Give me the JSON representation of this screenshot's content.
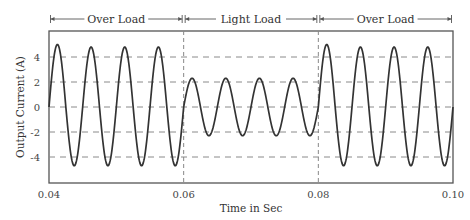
{
  "chart_data": {
    "type": "line",
    "title": "",
    "xlabel": "Time in Sec",
    "ylabel": "Output Current (A)",
    "xlim": [
      0.04,
      0.1
    ],
    "ylim": [
      -6,
      6
    ],
    "x_ticks": [
      "0.04",
      "0.06",
      "0.08",
      "0.10"
    ],
    "y_ticks": [
      "4",
      "2",
      "0",
      "-2",
      "-4"
    ],
    "grid": "horizontal dashed at y = -4, -2, 0, 2, 4",
    "frequency_hz": 200,
    "annotations": [
      {
        "label": "Over Load",
        "x_start": 0.04,
        "x_end": 0.06
      },
      {
        "label": "Light Load",
        "x_start": 0.06,
        "x_end": 0.08
      },
      {
        "label": "Over Load",
        "x_start": 0.08,
        "x_end": 0.1
      }
    ],
    "vertical_markers": [
      0.06,
      0.08
    ],
    "series": [
      {
        "name": "Output Current",
        "segments": [
          {
            "x_start": 0.04,
            "x_end": 0.06,
            "amplitude": 4.8,
            "first_peak": 5.0,
            "trough": -4.7
          },
          {
            "x_start": 0.06,
            "x_end": 0.08,
            "amplitude": 2.3,
            "first_peak": 2.3,
            "trough": -2.3
          },
          {
            "x_start": 0.08,
            "x_end": 0.1,
            "amplitude": 4.8,
            "first_peak": 5.0,
            "trough": -4.7
          }
        ],
        "peaks": [
          {
            "x": 0.04125,
            "y": 5.0
          },
          {
            "x": 0.04625,
            "y": 4.8
          },
          {
            "x": 0.05125,
            "y": 4.8
          },
          {
            "x": 0.05625,
            "y": 4.8
          },
          {
            "x": 0.06125,
            "y": 2.3
          },
          {
            "x": 0.06625,
            "y": 2.3
          },
          {
            "x": 0.07125,
            "y": 2.3
          },
          {
            "x": 0.07625,
            "y": 2.3
          },
          {
            "x": 0.08125,
            "y": 5.0
          },
          {
            "x": 0.08625,
            "y": 4.8
          },
          {
            "x": 0.09125,
            "y": 4.8
          },
          {
            "x": 0.09625,
            "y": 4.8
          }
        ],
        "troughs": [
          {
            "x": 0.04375,
            "y": -4.7
          },
          {
            "x": 0.04875,
            "y": -4.7
          },
          {
            "x": 0.05375,
            "y": -4.7
          },
          {
            "x": 0.05875,
            "y": -4.7
          },
          {
            "x": 0.06375,
            "y": -2.3
          },
          {
            "x": 0.06875,
            "y": -2.3
          },
          {
            "x": 0.07375,
            "y": -2.3
          },
          {
            "x": 0.07875,
            "y": -2.3
          },
          {
            "x": 0.08375,
            "y": -4.7
          },
          {
            "x": 0.08875,
            "y": -4.7
          },
          {
            "x": 0.09375,
            "y": -4.7
          },
          {
            "x": 0.09875,
            "y": -4.7
          }
        ]
      }
    ],
    "colors": {
      "line": "#333333",
      "grid": "#888888",
      "frame": "#555555"
    }
  }
}
